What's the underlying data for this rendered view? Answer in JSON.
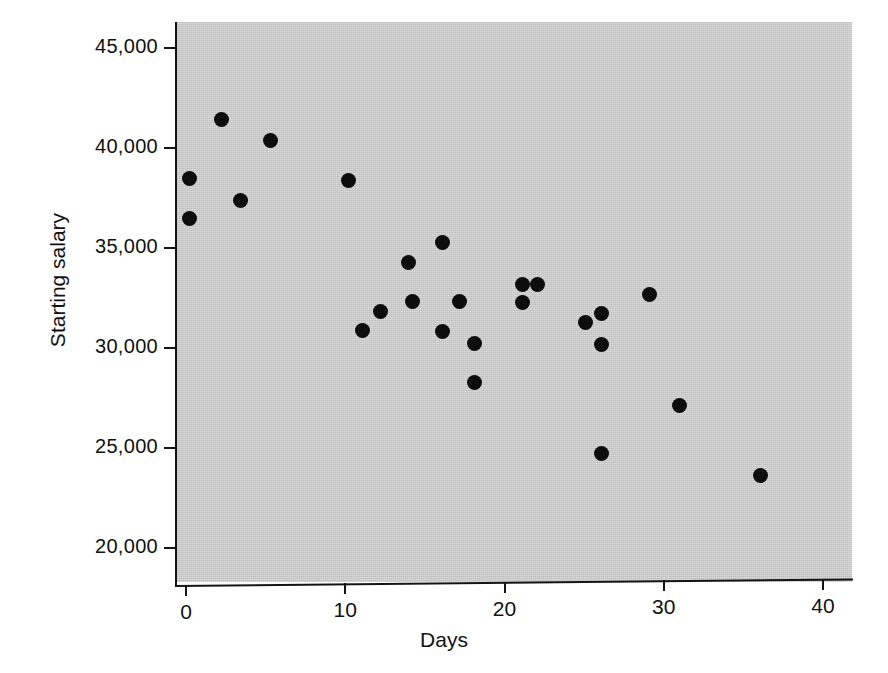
{
  "chart_data": {
    "type": "scatter",
    "title": "",
    "xlabel": "Days",
    "ylabel": "Starting salary",
    "xlim": [
      -1.5,
      42.5
    ],
    "ylim": [
      19000,
      45800
    ],
    "xticks": [
      0,
      10,
      20,
      30,
      40
    ],
    "xtick_labels": [
      "0",
      "10",
      "20",
      "30",
      "40"
    ],
    "yticks": [
      20000,
      25000,
      30000,
      35000,
      40000,
      45000
    ],
    "ytick_labels": [
      "20,000",
      "25,000",
      "30,000",
      "35,000",
      "40,000",
      "45,000"
    ],
    "grid": false,
    "legend": null,
    "marker": "filled-circle",
    "marker_color": "#0d0d0d",
    "plot_background_color": "#c9c9c9",
    "figure_background_color": "#ffffff",
    "n_points": 28,
    "points": [
      {
        "x": 0.2,
        "y": 38500
      },
      {
        "x": 0.2,
        "y": 36500
      },
      {
        "x": 2.2,
        "y": 41450
      },
      {
        "x": 3.4,
        "y": 37400
      },
      {
        "x": 5.3,
        "y": 40400
      },
      {
        "x": 10.2,
        "y": 38400
      },
      {
        "x": 11.1,
        "y": 30900
      },
      {
        "x": 12.2,
        "y": 31850
      },
      {
        "x": 14.0,
        "y": 34300
      },
      {
        "x": 14.2,
        "y": 32350
      },
      {
        "x": 16.1,
        "y": 35300
      },
      {
        "x": 16.1,
        "y": 30850
      },
      {
        "x": 17.2,
        "y": 32350
      },
      {
        "x": 18.1,
        "y": 30250
      },
      {
        "x": 18.1,
        "y": 28300
      },
      {
        "x": 21.1,
        "y": 33200
      },
      {
        "x": 21.1,
        "y": 32300
      },
      {
        "x": 22.1,
        "y": 33200
      },
      {
        "x": 25.1,
        "y": 31300
      },
      {
        "x": 26.1,
        "y": 31750
      },
      {
        "x": 26.1,
        "y": 30200
      },
      {
        "x": 26.1,
        "y": 24750
      },
      {
        "x": 29.1,
        "y": 32700
      },
      {
        "x": 31.0,
        "y": 27150
      },
      {
        "x": 36.1,
        "y": 23650
      }
    ]
  }
}
